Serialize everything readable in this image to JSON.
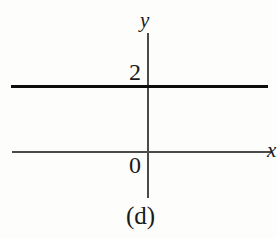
{
  "figure": {
    "caption": "(d)",
    "background_color": "#fdfdfc",
    "ink_color": "#0d0d0d",
    "axis_color": "#4a4a4a"
  },
  "axes": {
    "y_axis_label": "y",
    "x_axis_label": "x",
    "origin_label": "0",
    "y_tick_label": "2"
  },
  "chart_data": {
    "type": "line",
    "title": "(d)",
    "xlabel": "x",
    "ylabel": "y",
    "grid": false,
    "legend": null,
    "xlim": [
      -6,
      6
    ],
    "ylim": [
      -1.5,
      3.5
    ],
    "xticks": [],
    "yticks": [
      0,
      2
    ],
    "ytick_labels": [
      "0",
      "2"
    ],
    "series": [
      {
        "name": "y = 2",
        "x": [
          -6,
          6
        ],
        "values": [
          2,
          2
        ],
        "style": "solid",
        "linewidth": 3,
        "color": "#0d0d0d"
      }
    ],
    "annotations": [
      {
        "text": "2",
        "x": -0.4,
        "y": 2.35
      },
      {
        "text": "0",
        "x": -0.4,
        "y": -0.45
      },
      {
        "text": "y",
        "x": 0.0,
        "y": 3.3
      },
      {
        "text": "x",
        "x": 5.9,
        "y": -0.2
      }
    ]
  }
}
